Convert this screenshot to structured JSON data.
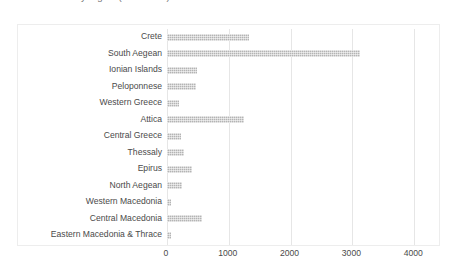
{
  "chart_data": {
    "type": "bar",
    "orientation": "horizontal",
    "title": "Number of beds by region (hotel beds)",
    "xlabel": "",
    "ylabel": "",
    "categories": [
      "Crete",
      "South Aegean",
      "Ionian Islands",
      "Peloponnese",
      "Western Greece",
      "Attica",
      "Central Greece",
      "Thessaly",
      "Epirus",
      "North Aegean",
      "Western Macedonia",
      "Central Macedonia",
      "Eastern Macedonia & Thrace"
    ],
    "values": [
      1320,
      3120,
      490,
      470,
      200,
      1250,
      230,
      280,
      400,
      240,
      60,
      560,
      70
    ],
    "xlim": [
      0,
      4300
    ],
    "xticks": [
      0,
      1000,
      2000,
      3000,
      4000
    ],
    "xtick_labels": [
      "0",
      "1000",
      "2000",
      "3000",
      "4000"
    ],
    "grid": true,
    "legend": false,
    "bar_color": "#b4b4b4",
    "gridline_color": "#e6e6e6",
    "frame_color": "#ededed",
    "text_color": "#4a4a4a"
  }
}
